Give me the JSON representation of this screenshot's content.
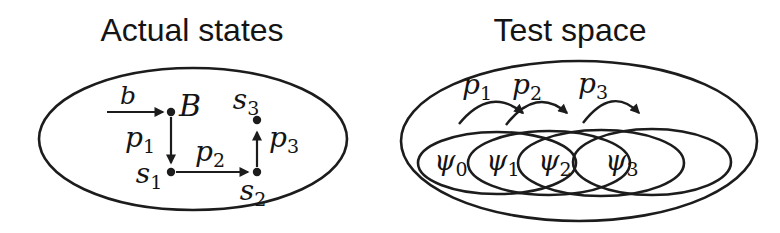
{
  "figure": {
    "ink_color": "#1c1c1c",
    "background_color": "#ffffff"
  },
  "left": {
    "title": "Actual states",
    "labels": {
      "b": {
        "main": "b",
        "sub": ""
      },
      "B": {
        "main": "B",
        "sub": ""
      },
      "p1": {
        "main": "p",
        "sub": "1"
      },
      "p2": {
        "main": "p",
        "sub": "2"
      },
      "p3": {
        "main": "p",
        "sub": "3"
      },
      "s1": {
        "main": "s",
        "sub": "1"
      },
      "s2": {
        "main": "s",
        "sub": "2"
      },
      "s3": {
        "main": "s",
        "sub": "3"
      }
    }
  },
  "right": {
    "title": "Test space",
    "set_labels": {
      "psi0": {
        "main": "ψ",
        "sub": "0"
      },
      "psi1": {
        "main": "ψ",
        "sub": "1"
      },
      "psi2": {
        "main": "ψ",
        "sub": "2"
      },
      "psi3": {
        "main": "ψ",
        "sub": "3"
      }
    },
    "hop_labels": {
      "p1": {
        "main": "p",
        "sub": "1"
      },
      "p2": {
        "main": "p",
        "sub": "2"
      },
      "p3": {
        "main": "p",
        "sub": "3"
      }
    }
  }
}
